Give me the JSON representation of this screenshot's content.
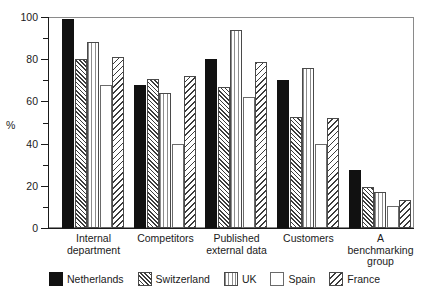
{
  "chart_data": {
    "type": "bar",
    "title": "",
    "xlabel": "",
    "ylabel": "%",
    "ylim": [
      0,
      100
    ],
    "yticks": [
      0,
      20,
      40,
      60,
      80,
      100
    ],
    "yticks_minor": [
      10,
      30,
      50,
      70,
      90
    ],
    "grid": false,
    "legend_position": "bottom",
    "categories": [
      "Internal department",
      "Competitors",
      "Published external data",
      "Customers",
      "A benchmarking group"
    ],
    "category_labels": [
      [
        "Internal",
        "department"
      ],
      [
        "Competitors"
      ],
      [
        "Published",
        "external data"
      ],
      [
        "Customers"
      ],
      [
        "A",
        "benchmarking",
        "group"
      ]
    ],
    "series": [
      {
        "name": "Netherlands",
        "fill": "solid",
        "values": [
          99,
          68,
          80,
          70,
          27.5
        ]
      },
      {
        "name": "Switzerland",
        "fill": "diag-dense",
        "values": [
          80,
          70.5,
          67,
          52.5,
          19.5
        ]
      },
      {
        "name": "UK",
        "fill": "vertical",
        "values": [
          88,
          64,
          94,
          76,
          17
        ]
      },
      {
        "name": "Spain",
        "fill": "empty",
        "values": [
          68,
          40,
          62,
          40,
          10.5
        ]
      },
      {
        "name": "France",
        "fill": "diag-sparse",
        "values": [
          81,
          72,
          78.5,
          52,
          13.5
        ]
      }
    ]
  },
  "legend": {
    "items": [
      {
        "label": "Netherlands"
      },
      {
        "label": "Switzerland"
      },
      {
        "label": "UK"
      },
      {
        "label": "Spain"
      },
      {
        "label": "France"
      }
    ]
  }
}
